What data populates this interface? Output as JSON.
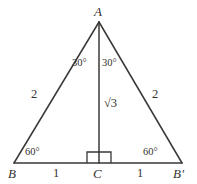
{
  "figure": {
    "type": "geometry-diagram",
    "shape": "isosceles-triangle-with-altitude",
    "background_color": "#ffffff",
    "stroke_color": "#3a3836",
    "text_color": "#33312f",
    "canvas": {
      "width": 197,
      "height": 184
    },
    "vertices": {
      "apex": {
        "label": "A",
        "x": 99,
        "y": 22
      },
      "base_left": {
        "label": "B",
        "x": 14,
        "y": 163
      },
      "base_right": {
        "label": "B'",
        "x": 182,
        "y": 163
      },
      "foot": {
        "label": "C",
        "x": 99,
        "y": 163
      }
    },
    "angles": {
      "apex_left": "30°",
      "apex_right": "30°",
      "base_left": "60°",
      "base_right": "60°",
      "foot_right_angle": "right-angle-marker"
    },
    "lengths": {
      "side_left": "2",
      "side_right": "2",
      "altitude": "√3",
      "base_left_half": "1",
      "base_right_half": "1"
    }
  }
}
